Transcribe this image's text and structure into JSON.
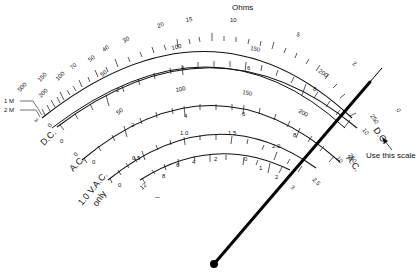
{
  "title": "Ohms",
  "scales": [
    {
      "id": "ohms",
      "name": "Ohms",
      "labels": [
        "2 M",
        "1 M",
        "500",
        "200",
        "150",
        "100",
        "70",
        "50",
        "40",
        "30",
        "20",
        "15",
        "10",
        "5",
        "2",
        "0"
      ],
      "left_end": "∞"
    },
    {
      "id": "dc",
      "name": "D.C.",
      "labels_outer": [
        "0",
        "50",
        "100",
        "150",
        "200",
        "250"
      ],
      "labels_inner": [
        "0",
        "2",
        "4",
        "6",
        "8",
        "10"
      ]
    },
    {
      "id": "ac",
      "name": "A.C.",
      "labels_outer": [
        "0",
        "50",
        "100",
        "150",
        "200",
        "250"
      ],
      "labels_inner": [
        "0",
        "2",
        "4",
        "6",
        "8",
        "10"
      ]
    },
    {
      "id": "ac10",
      "name": "10 V A.C. only",
      "name_line1": "1.0 V.A.C.",
      "name_line2": "only",
      "labels_outer": [
        "0",
        "0.5",
        "1.0",
        "1.5",
        "2.0",
        "2.5"
      ],
      "labels_inner": [
        "12",
        "8",
        "6",
        "4",
        "2",
        "0",
        "1",
        "2",
        "3"
      ],
      "db_minus": "–"
    }
  ],
  "left_labels": {
    "two_m": "2 M",
    "one_m": "1 M",
    "five_hundred": "500",
    "infinity": "∞"
  },
  "side_labels": {
    "dc": "D.C.",
    "ac": "A.C.",
    "ac10_line1": "1.0 V.A.C.",
    "ac10_line2": "only",
    "dc_right": "D.C.",
    "ac_right": "A.C.",
    "right_dc_num": "10",
    "right_ac_num": "10"
  },
  "annotation": {
    "text": "Use this scale",
    "arrow": "arrow-icon"
  },
  "needle": {
    "pivot": [
      214,
      264
    ],
    "tip": [
      382,
      77
    ],
    "color": "#000000"
  },
  "colors": {
    "ink": "#111111",
    "background": "#ffffff"
  }
}
